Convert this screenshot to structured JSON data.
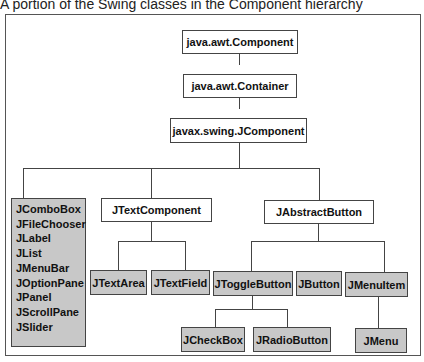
{
  "caption": "A portion of the Swing classes in the Component hierarchy",
  "nodes": {
    "component": "java.awt.Component",
    "container": "java.awt.Container",
    "jcomponent": "javax.swing.JComponent",
    "jtextcomponent": "JTextComponent",
    "jabstractbutton": "JAbstractButton",
    "jtextarea": "JTextArea",
    "jtextfield": "JTextField",
    "jtogglebutton": "JToggleButton",
    "jbutton": "JButton",
    "jmenuitem": "JMenuItem",
    "jcheckbox": "JCheckBox",
    "jradiobutton": "JRadioButton",
    "jmenu": "JMenu"
  },
  "direct_subclasses": [
    "JComboBox",
    "JFileChooser",
    "JLabel",
    "JList",
    "JMenuBar",
    "JOptionPane",
    "JPanel",
    "JScrollPane",
    "JSlider"
  ],
  "colors": {
    "concrete_class_fill": "#c8c8c8",
    "abstract_class_fill": "#ffffff",
    "border": "#444444"
  }
}
